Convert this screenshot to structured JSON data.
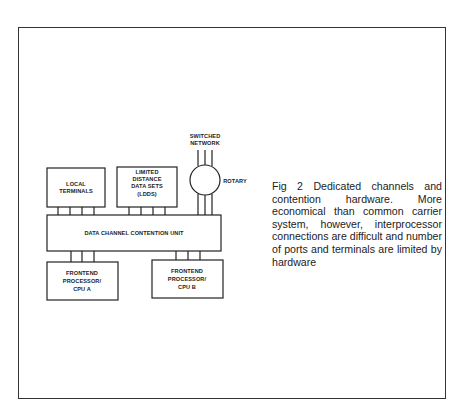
{
  "figure": {
    "boxes": {
      "local_terminals": [
        "LOCAL",
        "TERMINALS"
      ],
      "ldds": [
        "LIMITED",
        "DISTANCE",
        "DATA SETS",
        "(LDDS)"
      ],
      "contention_unit": "DATA CHANNEL CONTENTION UNIT",
      "frontend_a": [
        "FRONTEND",
        "PROCESSOR/",
        "CPU A"
      ],
      "frontend_b": [
        "FRONTEND",
        "PROCESSOR/",
        "CPU B"
      ]
    },
    "switched_network": [
      "SWITCHED",
      "NETWORK"
    ],
    "rotary": "ROTARY",
    "caption": "Fig 2  Dedicated channels and contention hardware. More economical than common carrier system, however, interprocessor connections are difficult and number of ports and terminals are limited by hardware"
  }
}
